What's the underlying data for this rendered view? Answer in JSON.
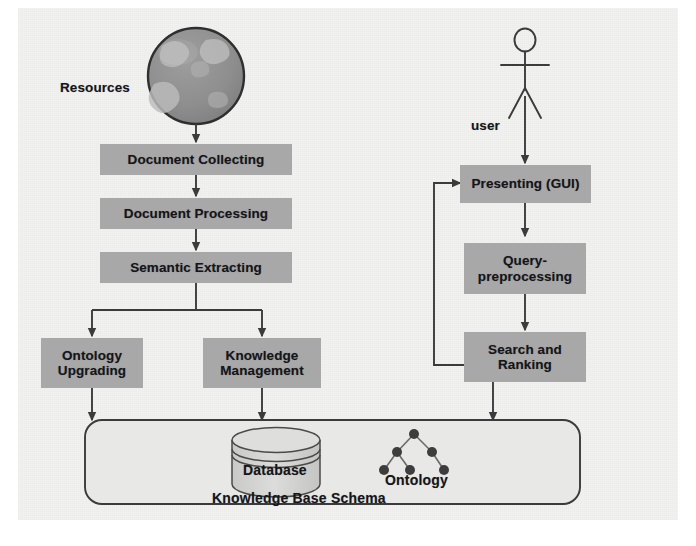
{
  "diagram": {
    "background_color": "#f2f2f0",
    "box_fill_color": "#a8a8a8",
    "line_color": "#3b3b3b",
    "text_color": "#15151a"
  },
  "labels": {
    "resources": "Resources",
    "user": "user"
  },
  "left_pipeline": [
    {
      "id": "document-collecting",
      "label": "Document Collecting"
    },
    {
      "id": "document-processing",
      "label": "Document Processing"
    },
    {
      "id": "semantic-extracting",
      "label": "Semantic Extracting"
    }
  ],
  "left_branch": [
    {
      "id": "ontology-upgrading",
      "line1": "Ontology",
      "line2": "Upgrading"
    },
    {
      "id": "knowledge-management",
      "line1": "Knowledge",
      "line2": "Management"
    }
  ],
  "right_pipeline": [
    {
      "id": "presenting-gui",
      "line1": "Presenting (GUI)",
      "line2": ""
    },
    {
      "id": "query-preprocessing",
      "line1": "Query-",
      "line2": "preprocessing"
    },
    {
      "id": "search-and-ranking",
      "line1": "Search and",
      "line2": "Ranking"
    }
  ],
  "knowledge_base": {
    "container_label": "Knowledge Base Schema",
    "database_label": "Database",
    "ontology_label": "Ontology"
  },
  "icons": {
    "globe": "globe-icon",
    "actor": "actor-stick-figure-icon",
    "database": "database-cylinder-icon",
    "ontology_tree": "ontology-tree-icon"
  }
}
